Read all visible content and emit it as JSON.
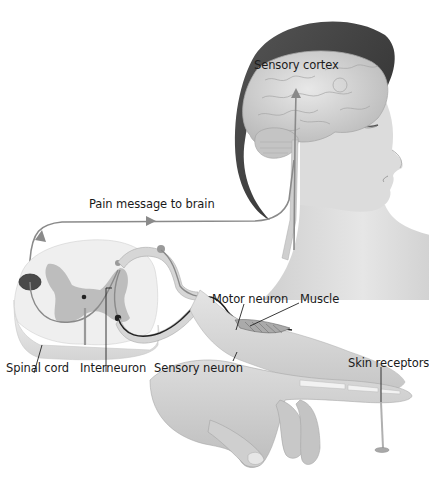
{
  "diagram": {
    "type": "pain reflex / sensory pathway illustration",
    "colors": {
      "background": "#ffffff",
      "hair": "#3a3a3a",
      "skin": "#d6d6d6",
      "brain": "#c9c9c9",
      "spinal_white_matter": "#ececec",
      "spinal_gray_matter": "#b8b8b8",
      "pathway_line": "#8a8a8a",
      "motor_neuron": "#222222",
      "label_text": "#1a1a1a"
    },
    "labels": {
      "sensory_cortex": "Sensory cortex",
      "pain_message": "Pain message to brain",
      "motor_neuron": "Motor neuron",
      "muscle": "Muscle",
      "spinal_cord": "Spinal cord",
      "interneuron": "Interneuron",
      "sensory_neuron": "Sensory neuron",
      "skin_receptors": "Skin receptors"
    },
    "components": [
      {
        "id": "head",
        "description": "Woman's head in profile, facing right, with transparent skull showing brain"
      },
      {
        "id": "brain",
        "description": "Cerebrum and cerebellum with arrow rising to sensory cortex"
      },
      {
        "id": "spinal_cord",
        "description": "Cross-section of spinal cord with butterfly-shaped gray matter"
      },
      {
        "id": "pathway",
        "description": "Arrowed line carrying pain message from spinal cord up to brain"
      },
      {
        "id": "sensory_neuron",
        "description": "Neuron from skin receptors in finger to spinal cord"
      },
      {
        "id": "motor_neuron",
        "description": "Dark neuron from spinal cord to arm muscle"
      },
      {
        "id": "interneuron",
        "description": "Short neuron inside spinal cord connecting sensory and motor neurons"
      },
      {
        "id": "hand",
        "description": "Hand with extended finger touching a pin/tack"
      },
      {
        "id": "tack",
        "description": "Sharp pin pressing into fingertip"
      }
    ]
  }
}
